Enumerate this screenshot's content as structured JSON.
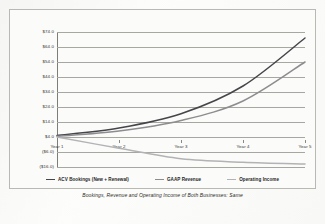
{
  "caption": "Bookings, Revenue and Operating Income of Both Businesses: Same",
  "legend": {
    "items": [
      {
        "label": "ACV Bookings (New + Renewal)",
        "color": "#46464a",
        "swatch_name": "legend-swatch-acv-bookings"
      },
      {
        "label": "GAAP Revenue",
        "color": "#8d8d8f",
        "swatch_name": "legend-swatch-gaap-revenue"
      },
      {
        "label": "Operating Income",
        "color": "#b3b3b5",
        "swatch_name": "legend-swatch-operating-income"
      }
    ]
  },
  "chart_data": {
    "type": "line",
    "title": "",
    "subtitle": "",
    "xlabel": "",
    "ylabel": "",
    "categories": [
      "Year 1",
      "Year 2",
      "Year 3",
      "Year 4",
      "Year 5"
    ],
    "ytick_labels": [
      "$74.0",
      "$64.0",
      "$54.0",
      "$44.0",
      "$34.0",
      "$24.0",
      "$14.0",
      "$4.0",
      "($6.0)",
      "($16.0)"
    ],
    "ytick_values": [
      74,
      64,
      54,
      44,
      34,
      24,
      14,
      4,
      -6,
      -16
    ],
    "ylim": [
      -16,
      74
    ],
    "grid": true,
    "legend_position": "bottom",
    "series": [
      {
        "name": "ACV Bookings (New + Renewal)",
        "color": "#46464a",
        "values": [
          5.0,
          10.0,
          19.5,
          38.0,
          70.0
        ]
      },
      {
        "name": "GAAP Revenue",
        "color": "#8d8d8f",
        "values": [
          4.5,
          8.0,
          15.0,
          28.0,
          54.0
        ]
      },
      {
        "name": "Operating Income",
        "color": "#b3b3b5",
        "values": [
          4.0,
          -3.5,
          -10.5,
          -12.8,
          -14.0
        ]
      }
    ]
  }
}
